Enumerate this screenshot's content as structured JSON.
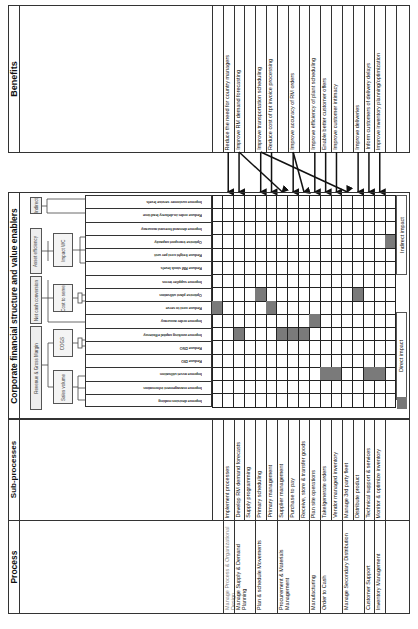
{
  "sections": {
    "benefits": "Benefits",
    "corporate": "Corporate financial structure and value enablers",
    "subprocesses": "Sub-processes",
    "process": "Process"
  },
  "benefits": [
    "Reduce the need for country managers",
    "Improve RM demand forecasting",
    "",
    "Improve transportation scheduling",
    "Reduce cost of tpt invoice processing",
    "",
    "Improve accuracy of RM orders",
    "",
    "Improve efficiency of plant scheduling",
    "Enable better customer offers",
    "Improve customer intimacy",
    "",
    "Improve deliveries",
    "Inform customers of delivery delays",
    "Improve inventory planning/optimization"
  ],
  "tree": {
    "level1": [
      "Revenue & Gross Margin",
      "Net cash conversion",
      "Asset efficiency",
      "Indirect"
    ],
    "level2": [
      "Sales volume",
      "COGS",
      "Cost to serve",
      "Impact WC"
    ]
  },
  "impact_labels": {
    "indirect": "Indirect impact",
    "direct": "Direct impact"
  },
  "grid": {
    "rows": 16,
    "cols": 17,
    "shaded": [
      [
        3,
        16
      ],
      [
        7,
        4
      ],
      [
        7,
        13
      ],
      [
        8,
        0
      ],
      [
        8,
        5
      ],
      [
        9,
        9
      ],
      [
        10,
        2
      ],
      [
        10,
        6
      ],
      [
        10,
        7
      ],
      [
        10,
        8
      ],
      [
        13,
        10
      ],
      [
        13,
        11
      ],
      [
        13,
        14
      ],
      [
        13,
        15
      ]
    ]
  },
  "subprocesses": [
    "Implement processes",
    "Develop RM demand forecasts",
    "Supply programming",
    "Primary scheduling",
    "Primary management",
    "Supplier management",
    "Purchase to pay",
    "Receive, store & transfer goods",
    "Plan site operations",
    "Take/generate orders",
    "Vendor managed inventory",
    "Manage 3rd party fleet",
    "Distribute product",
    "Technical support & services",
    "Monitor & optimize inventory"
  ],
  "processes": [
    {
      "label": "Manage Process & Organizational Design",
      "span": 1
    },
    {
      "label": "Manage Supply & Demand Planning",
      "span": 2
    },
    {
      "label": "Plan & schedule Movements",
      "span": 2
    },
    {
      "label": "Procurement & Materials Management",
      "span": 3
    },
    {
      "label": "Manufacturing",
      "span": 1
    },
    {
      "label": "Order to Cash",
      "span": 2
    },
    {
      "label": "Manage Secondary Distribution",
      "span": 2
    },
    {
      "label": "Customer Support",
      "span": 1
    },
    {
      "label": "Inventory Management",
      "span": 1
    }
  ],
  "drivers": [
    "Improve customer service levels",
    "Reduce order-to-delivery lead time",
    "Improve demand forecast accuracy",
    "Optimise transport capacity",
    "Reduce freight cost per unit",
    "Reduce RM stock levels",
    "Improve supplier terms",
    "Optimise plant utilisation",
    "Reduce cost to serve",
    "Improve order accuracy",
    "Improve working capital efficiency",
    "Reduce DSO",
    "Reduce DIO",
    "Improve asset utilisation",
    "Improve management information",
    "Improve decision making"
  ]
}
